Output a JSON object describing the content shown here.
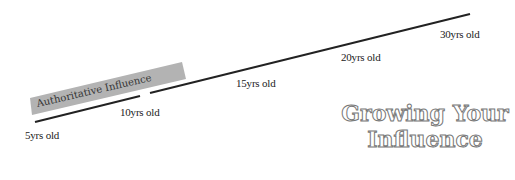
{
  "diagram": {
    "title_line1": "Growing Your",
    "title_line2": "Influence",
    "band_label": "Authoritative Influence",
    "milestones": [
      {
        "label": "5yrs old"
      },
      {
        "label": "10yrs old"
      },
      {
        "label": "15yrs old"
      },
      {
        "label": "20yrs old"
      },
      {
        "label": "30yrs old"
      }
    ],
    "colors": {
      "line": "#222222",
      "band": "#b3b3b3",
      "title_stroke": "#777777"
    }
  }
}
